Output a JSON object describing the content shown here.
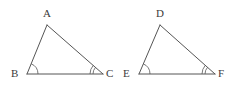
{
  "figure": {
    "kind": "geometry-diagram",
    "background_color": "#ffffff",
    "stroke_color": "#555555",
    "label_color": "#3b3b3b",
    "stroke_width": 1,
    "width": 234,
    "height": 88
  },
  "shapes": [
    {
      "id": "triangle-abc",
      "name": "triangle-abc",
      "vertices": [
        {
          "id": "vertex-a",
          "label": "A",
          "x": 47,
          "y": 25,
          "label_x": 43,
          "label_y": 8,
          "angle_marks": 0
        },
        {
          "id": "vertex-b",
          "label": "B",
          "x": 27,
          "y": 74,
          "label_x": 11,
          "label_y": 68,
          "angle_marks": 1
        },
        {
          "id": "vertex-c",
          "label": "C",
          "x": 103,
          "y": 74,
          "label_x": 106,
          "label_y": 68,
          "angle_marks": 2
        }
      ],
      "edges": [
        {
          "id": "edge-ab",
          "name": "segment-ab",
          "from": "vertex-a",
          "to": "vertex-b"
        },
        {
          "id": "edge-ac",
          "name": "segment-ac",
          "from": "vertex-a",
          "to": "vertex-c"
        },
        {
          "id": "edge-bc",
          "name": "segment-bc",
          "from": "vertex-b",
          "to": "vertex-c"
        }
      ]
    },
    {
      "id": "triangle-def",
      "name": "triangle-def",
      "vertices": [
        {
          "id": "vertex-d",
          "label": "D",
          "x": 160,
          "y": 25,
          "label_x": 156,
          "label_y": 8,
          "angle_marks": 0
        },
        {
          "id": "vertex-e",
          "label": "E",
          "x": 139,
          "y": 74,
          "label_x": 123,
          "label_y": 68,
          "angle_marks": 1
        },
        {
          "id": "vertex-f",
          "label": "F",
          "x": 215,
          "y": 74,
          "label_x": 218,
          "label_y": 68,
          "angle_marks": 2
        }
      ],
      "edges": [
        {
          "id": "edge-de",
          "name": "segment-de",
          "from": "vertex-d",
          "to": "vertex-e"
        },
        {
          "id": "edge-df",
          "name": "segment-df",
          "from": "vertex-d",
          "to": "vertex-f"
        },
        {
          "id": "edge-ef",
          "name": "segment-ef",
          "from": "vertex-e",
          "to": "vertex-f"
        }
      ]
    }
  ],
  "angle_arcs": [
    {
      "id": "arc-b",
      "name": "angle-arc-b",
      "vertex": "vertex-b",
      "radii": [
        11
      ]
    },
    {
      "id": "arc-c",
      "name": "angle-arc-c",
      "vertex": "vertex-c",
      "radii": [
        10,
        13
      ]
    },
    {
      "id": "arc-e",
      "name": "angle-arc-e",
      "vertex": "vertex-e",
      "radii": [
        11
      ]
    },
    {
      "id": "arc-f",
      "name": "angle-arc-f",
      "vertex": "vertex-f",
      "radii": [
        10,
        13
      ]
    }
  ]
}
